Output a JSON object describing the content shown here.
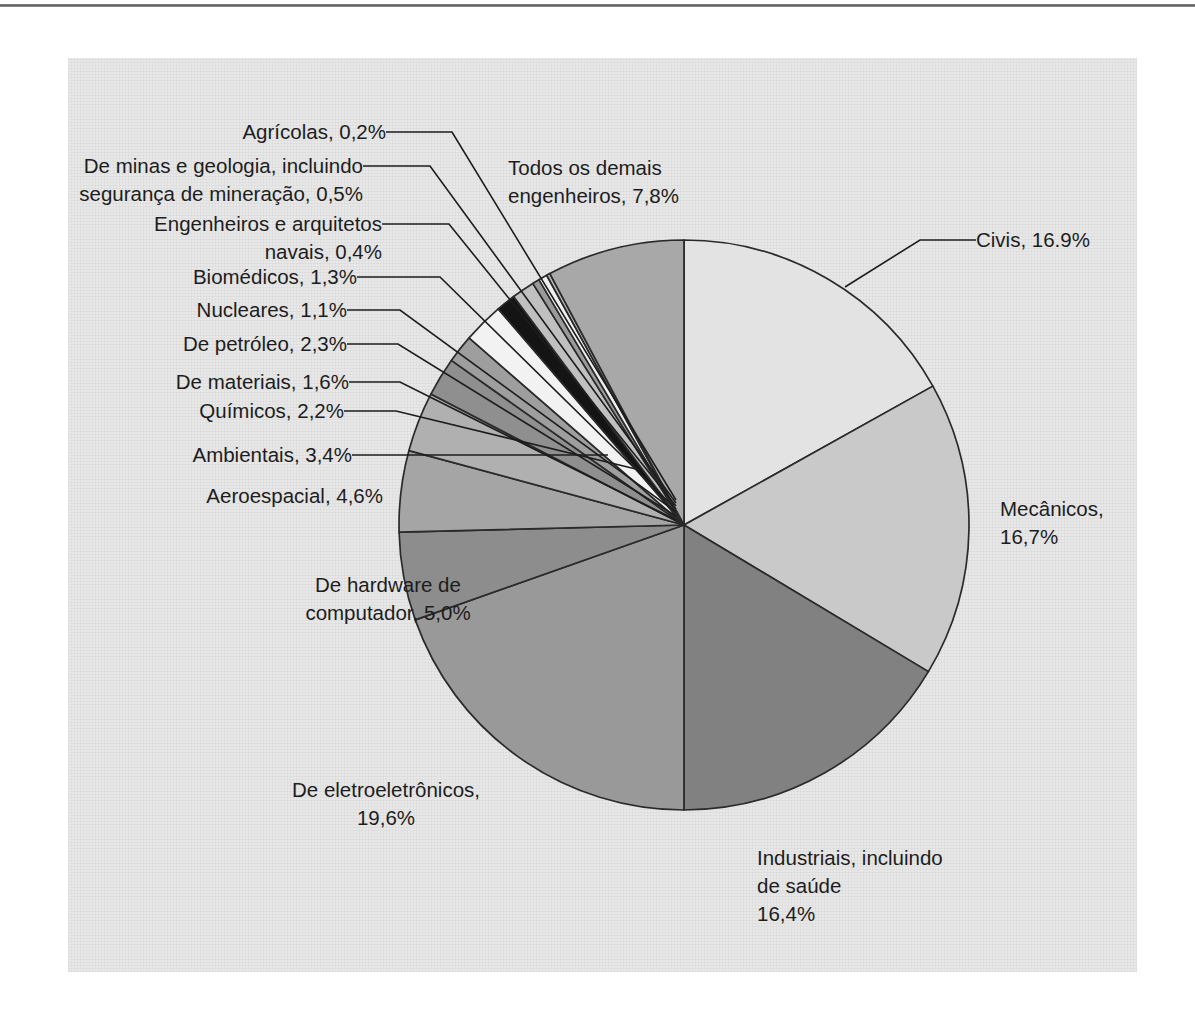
{
  "figure": {
    "background_color": "#e8e8e8",
    "page_color": "#ffffff",
    "rule_color": "#5d5d5d"
  },
  "chart_data": {
    "type": "pie",
    "title": "",
    "subtitle": "",
    "xlabel": "",
    "ylabel": "",
    "legend_position": "none",
    "grid": false,
    "start_angle_deg": 0,
    "direction": "clockwise",
    "total_percent": 100.0,
    "categories": [
      "Civis",
      "Mecânicos",
      "Industriais, incluindo de saúde",
      "De eletroeletrônicos",
      "De hardware de computador",
      "Aeroespacial",
      "Ambientais",
      "Químicos",
      "De materiais",
      "De petróleo",
      "Nucleares",
      "Biomédicos",
      "Engenheiros e arquitetos navais",
      "De minas e geologia, incluindo segurança de mineração",
      "Agrícolas",
      "Todos os demais engenheiros"
    ],
    "values": [
      16.9,
      16.7,
      16.4,
      19.6,
      5.0,
      4.6,
      3.4,
      2.2,
      1.6,
      2.3,
      1.1,
      1.3,
      0.4,
      0.5,
      0.2,
      7.8
    ],
    "value_labels": [
      "16.9%",
      "16,7%",
      "16,4%",
      "19,6%",
      "5,0%",
      "4,6%",
      "3,4%",
      "2,2%",
      "1,6%",
      "2,3%",
      "1,1%",
      "1,3%",
      "0,4%",
      "0,5%",
      "0,2%",
      "7,8%"
    ],
    "colors": [
      "#e3e3e3",
      "#c9c9c9",
      "#818181",
      "#999999",
      "#8d8d8d",
      "#a5a5a5",
      "#b0b0b0",
      "#8f8f8f",
      "#9e9e9e",
      "#f2f2f2",
      "#141414",
      "#c0c0c0",
      "#9a9a9a",
      "#efefef",
      "#b5b5b5",
      "#a8a8a8"
    ]
  },
  "labels": [
    {
      "id": "agricolas",
      "text_lines": [
        "Agrícolas, 0,2%"
      ],
      "align": "end",
      "has_leader": true
    },
    {
      "id": "minas",
      "text_lines": [
        "De minas e geologia, incluindo",
        "segurança de mineração, 0,5%"
      ],
      "align": "end",
      "has_leader": true
    },
    {
      "id": "navais",
      "text_lines": [
        "Engenheiros e arquitetos",
        "navais, 0,4%"
      ],
      "align": "end",
      "has_leader": true
    },
    {
      "id": "biomedicos",
      "text_lines": [
        "Biomédicos, 1,3%"
      ],
      "align": "end",
      "has_leader": true
    },
    {
      "id": "nucleares",
      "text_lines": [
        "Nucleares,  1,1%"
      ],
      "align": "end",
      "has_leader": true
    },
    {
      "id": "petroleo",
      "text_lines": [
        "De petróleo, 2,3%"
      ],
      "align": "end",
      "has_leader": true
    },
    {
      "id": "materiais",
      "text_lines": [
        "De materiais, 1,6%"
      ],
      "align": "end",
      "has_leader": true
    },
    {
      "id": "quimicos",
      "text_lines": [
        "Químicos, 2,2%"
      ],
      "align": "end",
      "has_leader": true
    },
    {
      "id": "ambientais",
      "text_lines": [
        "Ambientais, 3,4%"
      ],
      "align": "end",
      "has_leader": true
    },
    {
      "id": "aeroespacial",
      "text_lines": [
        "Aeroespacial, 4,6%"
      ],
      "align": "end",
      "has_leader": false
    },
    {
      "id": "hardware",
      "text_lines": [
        "De hardware de",
        "computador, 5,0%"
      ],
      "align": "middle",
      "has_leader": false
    },
    {
      "id": "eletroeletronicos",
      "text_lines": [
        "De eletroeletrônicos,",
        "19,6%"
      ],
      "align": "middle",
      "has_leader": false
    },
    {
      "id": "industriais",
      "text_lines": [
        "Industriais, incluindo",
        "de saúde",
        "16,4%"
      ],
      "align": "start",
      "has_leader": false
    },
    {
      "id": "mecanicos",
      "text_lines": [
        "Mecânicos,",
        "16,7%"
      ],
      "align": "start",
      "has_leader": false
    },
    {
      "id": "civis",
      "text_lines": [
        "Civis, 16.9%"
      ],
      "align": "start",
      "has_leader": true
    },
    {
      "id": "demais",
      "text_lines": [
        "Todos os demais",
        "engenheiros, 7,8%"
      ],
      "align": "start",
      "has_leader": false
    }
  ]
}
